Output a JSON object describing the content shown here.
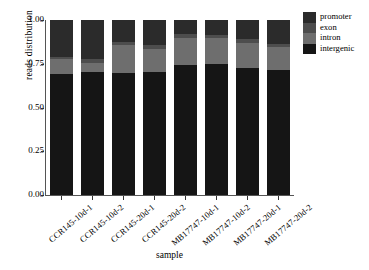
{
  "chart_data": {
    "type": "bar",
    "subtype": "stacked-bar-proportional",
    "title": "",
    "xlabel": "sample",
    "ylabel": "reads distribution",
    "ylim": [
      0.0,
      1.0
    ],
    "yticks": [
      "0.00",
      "0.25",
      "0.50",
      "0.75",
      "1.00"
    ],
    "ytick_values": [
      0.0,
      0.25,
      0.5,
      0.75,
      1.0
    ],
    "grid": false,
    "legend_position": "right",
    "categories": [
      "CCR145-10d-1",
      "CCR145-10d-2",
      "CCR145-20d-1",
      "CCR145-20d-2",
      "MB17747-10d-1",
      "MB17747-10d-2",
      "MB17747-20d-1",
      "MB17747-20d-2"
    ],
    "series": [
      {
        "name": "promoter",
        "color": "#2b2b2b",
        "values": [
          0.21,
          0.225,
          0.125,
          0.145,
          0.08,
          0.085,
          0.11,
          0.135
        ]
      },
      {
        "name": "exon",
        "color": "#4d4d4d",
        "values": [
          0.015,
          0.02,
          0.02,
          0.02,
          0.02,
          0.02,
          0.02,
          0.02
        ]
      },
      {
        "name": "intron",
        "color": "#6e6e6e",
        "values": [
          0.085,
          0.05,
          0.155,
          0.13,
          0.155,
          0.145,
          0.145,
          0.13
        ]
      },
      {
        "name": "intergenic",
        "color": "#151515",
        "values": [
          0.69,
          0.705,
          0.7,
          0.705,
          0.745,
          0.75,
          0.725,
          0.715
        ]
      }
    ],
    "stack_order_bottom_to_top": [
      "intergenic",
      "intron",
      "exon",
      "promoter"
    ]
  },
  "legend": {
    "items": [
      {
        "label": "promoter",
        "color": "#2b2b2b"
      },
      {
        "label": "exon",
        "color": "#4d4d4d"
      },
      {
        "label": "intron",
        "color": "#6e6e6e"
      },
      {
        "label": "intergenic",
        "color": "#151515"
      }
    ]
  },
  "axes": {
    "y_title": "reads distribution",
    "x_title": "sample"
  }
}
